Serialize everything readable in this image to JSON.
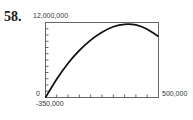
{
  "problem_number": "58.",
  "labels": {
    "ymax": "12,000,000",
    "xmin": "0",
    "xmax": "500,000",
    "ymin": "-350,000"
  },
  "chart_data": {
    "type": "line",
    "title": "",
    "xlabel": "",
    "ylabel": "",
    "xlim": [
      0,
      500000
    ],
    "ylim": [
      -350000,
      12000000
    ],
    "grid": false,
    "x_ticks_count": 10,
    "y_ticks_count": 12,
    "series": [
      {
        "name": "curve",
        "x": [
          0,
          50000,
          100000,
          150000,
          200000,
          250000,
          300000,
          350000,
          400000,
          450000,
          500000
        ],
        "y": [
          -350000,
          2700000,
          5300000,
          7400000,
          9100000,
          10400000,
          11300000,
          11700000,
          11600000,
          10900000,
          9700000
        ]
      }
    ]
  }
}
